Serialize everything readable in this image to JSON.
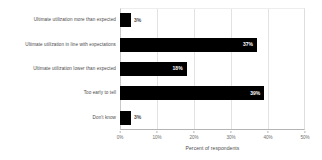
{
  "chart_data": {
    "type": "bar",
    "orientation": "horizontal",
    "title": "",
    "xlabel": "Percent of respondents",
    "ylabel": "",
    "xlim": [
      0,
      50
    ],
    "xtick_labels": [
      "0%",
      "10%",
      "20%",
      "30%",
      "40%",
      "50%"
    ],
    "xtick_values": [
      0,
      10,
      20,
      30,
      40,
      50
    ],
    "grid": true,
    "legend": false,
    "bar_color": "#000000",
    "categories": [
      "Ultimate utilization more than expected",
      "Ultimate utilization in line with expectations",
      "Ultimate utilization lower than expected",
      "Too early to tell",
      "Don't know"
    ],
    "values": [
      3,
      37,
      18,
      39,
      3
    ],
    "value_labels": [
      "3%",
      "37%",
      "18%",
      "39%",
      "3%"
    ],
    "label_placement": [
      "outside",
      "inside",
      "inside",
      "inside",
      "outside"
    ]
  }
}
